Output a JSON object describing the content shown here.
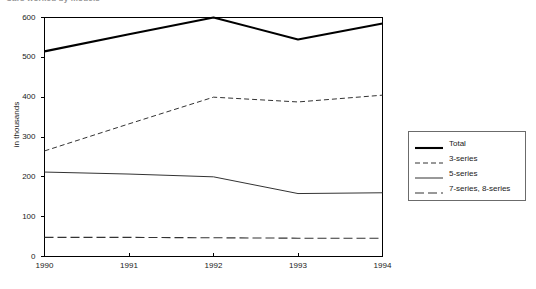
{
  "chart_data": {
    "type": "line",
    "title": "Cars worked by models",
    "title_clipped": true,
    "xlabel": "",
    "ylabel": "in thousands",
    "categories": [
      "1990",
      "1991",
      "1992",
      "1993",
      "1994"
    ],
    "x": [
      1990,
      1991,
      1992,
      1993,
      1994
    ],
    "ylim": [
      0,
      600
    ],
    "yticks": [
      "0",
      "100",
      "200",
      "300",
      "400",
      "500",
      "600"
    ],
    "ytick_values": [
      0,
      100,
      200,
      300,
      400,
      500,
      600
    ],
    "grid": false,
    "legend_position": "right",
    "series": [
      {
        "name": "Total",
        "style": "thick-solid",
        "values": [
          515,
          558,
          600,
          545,
          585
        ]
      },
      {
        "name": "3-series",
        "style": "short-dashed",
        "values": [
          265,
          333,
          400,
          388,
          405
        ]
      },
      {
        "name": "5-series",
        "style": "thin-solid",
        "values": [
          212,
          207,
          200,
          158,
          160
        ]
      },
      {
        "name": "7-series, 8-series",
        "style": "long-dashed",
        "values": [
          48,
          48,
          47,
          46,
          46
        ]
      }
    ],
    "colors": {
      "line": "#000000",
      "secondary_line": "#333333",
      "axis": "#000000",
      "background": "#ffffff",
      "legend_border": "#6b6b6b"
    }
  }
}
